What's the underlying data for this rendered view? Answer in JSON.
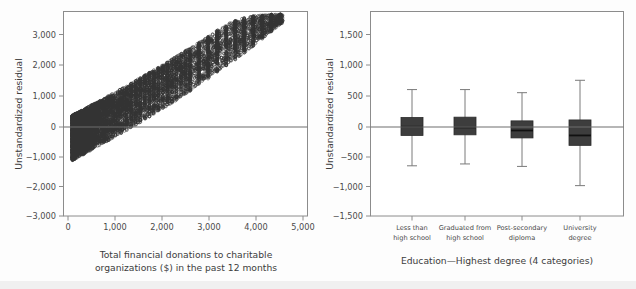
{
  "figure": {
    "background_color": "#fdfdfd",
    "panel_count": 2
  },
  "chart_data": [
    {
      "type": "scatter",
      "panel": "left",
      "title": "",
      "xlabel": "Total financial donations to charitable organizations ($) in the past 12 months",
      "xlabel_line1": "Total financial donations to charitable",
      "xlabel_line2": "organizations ($) in the past 12 months",
      "ylabel": "Unstandardized residual",
      "xlim": [
        -200,
        5200
      ],
      "ylim": [
        -3000,
        3600
      ],
      "xticks": [
        0,
        1000,
        2000,
        3000,
        4000,
        5000
      ],
      "xticklabels": [
        "0",
        "1,000",
        "2,000",
        "3,000",
        "4,000",
        "5,000"
      ],
      "yticks": [
        3000,
        2000,
        1000,
        0,
        -1000,
        -2000,
        -3000
      ],
      "yticklabels": [
        "3,000",
        "2,000",
        "1,000",
        "0",
        "−1,000",
        "−2,000",
        "−3,000"
      ],
      "grid": false,
      "reference_line_y": 0,
      "marker": "open-circle",
      "marker_color": "#3a3a3a",
      "description": "Dense wedge-shaped cloud of residuals fanning upward from x=0 to x=4600; lower edge rises linearly from about -1200 at x=0 to about +3400 at x=4600, upper edge rises from about +250 at x=0 to about +3500 at x=4600.",
      "envelope": {
        "x": [
          0,
          200,
          400,
          600,
          800,
          1000,
          1200,
          1400,
          1600,
          1800,
          2000,
          2200,
          2400,
          2600,
          2800,
          3000,
          3200,
          3400,
          3600,
          3800,
          4000,
          4200,
          4400,
          4600
        ],
        "y_lower": [
          -1200,
          -1050,
          -880,
          -720,
          -560,
          -400,
          -230,
          -60,
          110,
          290,
          470,
          650,
          840,
          1030,
          1230,
          1430,
          1630,
          1840,
          2050,
          2270,
          2490,
          2720,
          2960,
          3200
        ],
        "y_upper": [
          250,
          400,
          560,
          720,
          880,
          1040,
          1200,
          1370,
          1540,
          1710,
          1880,
          2060,
          2240,
          2420,
          2600,
          2790,
          2980,
          3170,
          3300,
          3400,
          3450,
          3480,
          3500,
          3510
        ]
      }
    },
    {
      "type": "boxplot",
      "panel": "right",
      "title": "",
      "xlabel": "Education—Highest degree (4 categories)",
      "ylabel": "Unstandardized residual",
      "ylim": [
        -1500,
        1800
      ],
      "yticks": [
        1500,
        1000,
        500,
        0,
        -500,
        -1000,
        -1500
      ],
      "yticklabels": [
        "1,500",
        "1,000",
        "500",
        "0",
        "−500",
        "−1,000",
        "−1,500"
      ],
      "grid": false,
      "reference_line_y": 0,
      "box_color": "#3d3d3d",
      "categories": [
        {
          "label": "Less than high school",
          "label_line1": "Less than",
          "label_line2": "high school"
        },
        {
          "label": "Graduated from high school",
          "label_line1": "Graduated from",
          "label_line2": "high school"
        },
        {
          "label": "Post-secondary diploma",
          "label_line1": "Post-secondary",
          "label_line2": "diploma"
        },
        {
          "label": "University degree",
          "label_line1": "University",
          "label_line2": "degree"
        }
      ],
      "boxes": [
        {
          "category": "Less than high school",
          "whisker_low": -690,
          "q1": -200,
          "median": -60,
          "q3": 90,
          "whisker_high": 540
        },
        {
          "category": "Graduated from high school",
          "whisker_low": -660,
          "q1": -190,
          "median": -70,
          "q3": 95,
          "whisker_high": 540
        },
        {
          "category": "Post-secondary diploma",
          "whisker_low": -700,
          "q1": -240,
          "median": -120,
          "q3": 35,
          "whisker_high": 490
        },
        {
          "category": "University degree",
          "whisker_low": -1010,
          "q1": -360,
          "median": -200,
          "q3": 50,
          "whisker_high": 690
        }
      ]
    }
  ]
}
